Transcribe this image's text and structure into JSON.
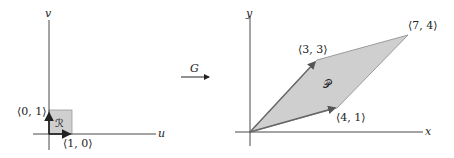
{
  "left": {
    "axis_u": "u",
    "axis_v": "v",
    "region": "ℛ",
    "label_e1": "⟨1, 0⟩",
    "label_e2": "⟨0, 1⟩"
  },
  "map": {
    "label": "G"
  },
  "right": {
    "axis_x": "x",
    "axis_y": "y",
    "region": "𝒫",
    "label_v1": "⟨3, 3⟩",
    "label_v2": "⟨4, 1⟩",
    "label_v3": "⟨7, 4⟩"
  },
  "colors": {
    "fill": "#cfcfcf",
    "stroke": "#777777",
    "axis": "#333333"
  }
}
